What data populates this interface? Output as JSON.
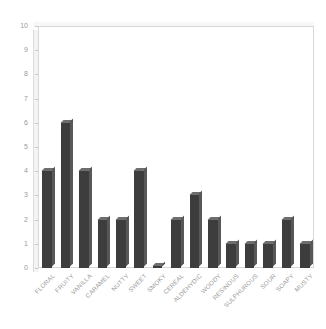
{
  "chart_data": {
    "type": "bar",
    "title": "",
    "xlabel": "",
    "ylabel": "",
    "ylim": [
      0,
      10
    ],
    "grid": false,
    "legend": "none",
    "categories": [
      "FLORAL",
      "FRUITY",
      "VANILLA",
      "CARAMEL",
      "NUTTY",
      "SWEET",
      "SMOKY",
      "CEREAL",
      "ALDEHYDIC",
      "WOODY",
      "RESINOUS",
      "SULPHUROUS",
      "SOUR",
      "SOAPY",
      "MUSTY"
    ],
    "values": [
      4,
      6,
      4,
      2,
      2,
      4,
      0.1,
      2,
      3,
      2,
      1,
      1,
      1,
      2,
      1
    ],
    "ytick_labels": [
      "0",
      "1",
      "2",
      "3",
      "4",
      "5",
      "6",
      "7",
      "8",
      "9",
      "10"
    ],
    "bar_color": "#3d3d3d",
    "bar_top_color": "#6e6e6e",
    "bar_side_color": "#585858",
    "axis_text_color": "#9a9a9a",
    "frame_color": "#d8d8d8",
    "background_color": "#ffffff"
  }
}
